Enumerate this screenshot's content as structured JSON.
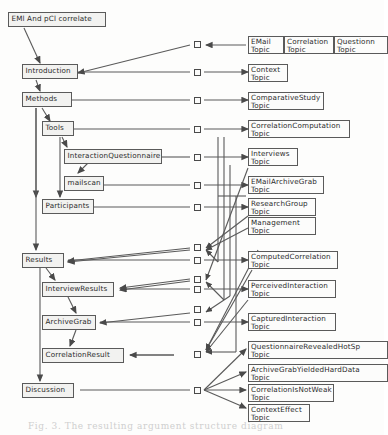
{
  "diagram": {
    "title_box": {
      "label": "EMl And pCl correlate"
    },
    "sections": [
      {
        "id": "introduction",
        "label": "Introduction"
      },
      {
        "id": "methods",
        "label": "Methods"
      },
      {
        "id": "tools",
        "label": "Tools"
      },
      {
        "id": "interaction_questionnaire",
        "label": "InteractionQuestionnaire"
      },
      {
        "id": "mailscan",
        "label": "mailscan"
      },
      {
        "id": "participants",
        "label": "Participants"
      },
      {
        "id": "results",
        "label": "Results"
      },
      {
        "id": "interview_results",
        "label": "InterviewResults"
      },
      {
        "id": "archive_grab",
        "label": "ArchiveGrab"
      },
      {
        "id": "correlation_result",
        "label": "CorrelationResult"
      },
      {
        "id": "discussion",
        "label": "Discussion"
      }
    ],
    "topics": [
      {
        "id": "email_topic",
        "line1": "EMail",
        "line2": "Topic"
      },
      {
        "id": "correlation_topic",
        "line1": "Correlation",
        "line2": "Topic"
      },
      {
        "id": "questionnaire_topic",
        "line1": "Questionn",
        "line2": "Topic"
      },
      {
        "id": "context_topic",
        "line1": "Context",
        "line2": "Topic"
      },
      {
        "id": "comparativestudy_topic",
        "line1": "ComparativeStudy",
        "line2": "Topic"
      },
      {
        "id": "correlationcomputation_topic",
        "line1": "CorrelationComputation",
        "line2": "Topic"
      },
      {
        "id": "interviews_topic",
        "line1": "Interviews",
        "line2": "Topic"
      },
      {
        "id": "emailarchivegrab_topic",
        "line1": "EMailArchiveGrab",
        "line2": "Topic"
      },
      {
        "id": "researchgroup_topic",
        "line1": "ResearchGroup",
        "line2": "Topic"
      },
      {
        "id": "management_topic",
        "line1": "Management",
        "line2": "Topic"
      },
      {
        "id": "computedcorrelation_topic",
        "line1": "ComputedCorrelation",
        "line2": "Topic"
      },
      {
        "id": "perceivedinteraction_topic",
        "line1": "PerceivedInteraction",
        "line2": "Topic"
      },
      {
        "id": "capturedinteraction_topic",
        "line1": "CapturedInteraction",
        "line2": "Topic"
      },
      {
        "id": "questionnairerevealedhotspot_topic",
        "line1": "QuestionnaireRevealedHotSp",
        "line2": "Topic"
      },
      {
        "id": "archivegrabyieldedharddata_topic",
        "line1": "ArchiveGrabYieldedHardData",
        "line2": "Topic"
      },
      {
        "id": "correlationisnotweak_topic",
        "line1": "CorrelationIsNotWeak",
        "line2": "Topic"
      },
      {
        "id": "contexteffect_topic",
        "line1": "ContextEffect",
        "line2": "Topic"
      }
    ],
    "caption": {
      "text": "Fig. 3.  The  resulting  argument structure  diagram"
    },
    "colors": {
      "node_fill": "#f2f2f0",
      "topic_fill": "#fcfcfb",
      "stroke": "#5a5a5a",
      "background": "#fdfdfc"
    }
  }
}
